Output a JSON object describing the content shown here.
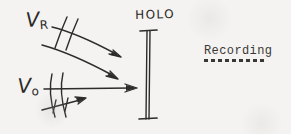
{
  "figure": {
    "kind": "hand-drawn-optics-diagram",
    "background_color": "#f4f3f1",
    "ink_color": "#2e2c2b",
    "width": 291,
    "height": 134
  },
  "labels": {
    "reference_beam": {
      "symbol": "V",
      "subscript": "R",
      "meaning": "reference-wave"
    },
    "object_beam": {
      "symbol": "V",
      "subscript": "o",
      "meaning": "object-wave"
    },
    "plate": {
      "text": "HOLO",
      "meaning": "holographic-plate"
    }
  },
  "caption": {
    "text": "Recording",
    "underline_style": "dashed"
  },
  "diagram_elements": {
    "reference_beam_rays": 2,
    "reference_beam_wavefront_ticks": 2,
    "object_beam_rays": 1,
    "object_beam_wavefronts": 2,
    "object_beam_tilt_arrow": 1,
    "plate_caps": 2
  }
}
